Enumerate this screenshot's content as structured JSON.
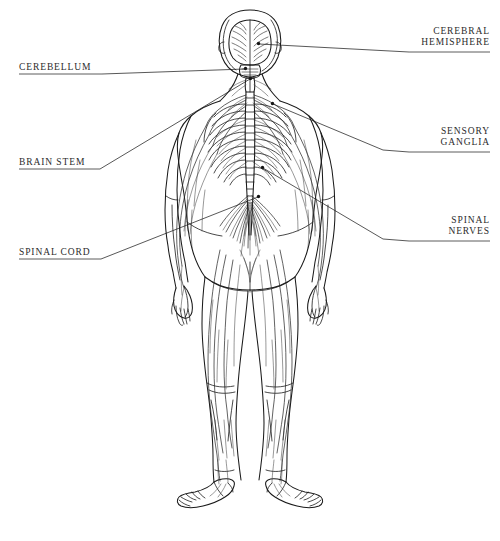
{
  "figure": {
    "ink_color": "#1a1a1a",
    "label_color": "#2b2b2b",
    "leader_color": "#3a3a3a",
    "background": "#ffffff"
  },
  "labels": {
    "cerebellum": {
      "text": "CEREBELLUM",
      "side": "left"
    },
    "brain_stem": {
      "text": "BRAIN STEM",
      "side": "left"
    },
    "spinal_cord": {
      "text": "SPINAL CORD",
      "side": "left"
    },
    "cerebral_hemisphere": {
      "line1": "CEREBRAL",
      "line2": "HEMISPHERE",
      "side": "right"
    },
    "sensory_ganglia": {
      "line1": "SENSORY",
      "line2": "GANGLIA",
      "side": "right"
    },
    "spinal_nerves": {
      "line1": "SPINAL",
      "line2": "NERVES",
      "side": "right"
    }
  }
}
